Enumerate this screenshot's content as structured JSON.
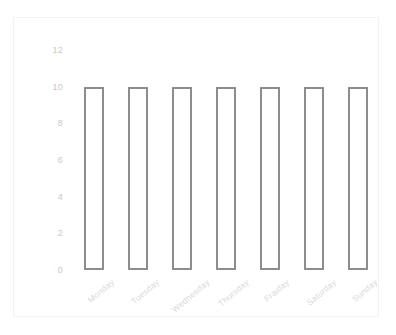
{
  "chart_data": {
    "type": "bar",
    "title": "",
    "subtitle": "",
    "xlabel": "",
    "ylabel": "",
    "categories": [
      "Monday",
      "Tuesday",
      "Wednesday",
      "Thursday",
      "Fraiday",
      "Saturday",
      "Sunday"
    ],
    "values": [
      10,
      10,
      10,
      10,
      10,
      10,
      10
    ],
    "ylim": [
      0,
      12
    ],
    "yticks": [
      12,
      10,
      8,
      6,
      4,
      2,
      0
    ],
    "ytick_labels": [
      "12",
      "10",
      "8",
      "6",
      "4",
      "2",
      "0"
    ],
    "grid": false,
    "legend": false,
    "legend_position": "none",
    "bar_style": "outline",
    "xtick_rotation_deg": -40
  },
  "style": {
    "background_color": "#ffffff",
    "frame_border_color": "#f2f2f2",
    "bar_stroke_color": "#8d8d8d",
    "bar_fill_color": "#ffffff",
    "ytick_label_color": "#c9c9c9",
    "xtick_label_color": "#d8d8d8"
  }
}
